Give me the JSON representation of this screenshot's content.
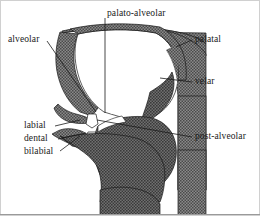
{
  "figure": {
    "type": "anatomical-diagram",
    "colors": {
      "tissue_fill": "#7d7d7d",
      "cavity_fill": "#ffffff",
      "outline": "#1a1a1a",
      "leader_line": "#1a1a1a",
      "text": "#1a1a1a",
      "border": "#cccccc",
      "background": "#ffffff"
    },
    "labels": [
      {
        "id": "palato-alveolar",
        "text": "palato-alveolar",
        "x": 107,
        "y": 8,
        "align": "left",
        "leader": {
          "x1": 105,
          "y1": 18,
          "x2": 105,
          "y2": 113
        }
      },
      {
        "id": "alveolar",
        "text": "alveolar",
        "x": 8,
        "y": 34,
        "align": "left",
        "leader": {
          "x1": 47,
          "y1": 41,
          "x2": 96,
          "y2": 112
        }
      },
      {
        "id": "palatal",
        "text": "palatal",
        "x": 195,
        "y": 34,
        "align": "left",
        "leader": {
          "x1": 192,
          "y1": 40,
          "x2": 176,
          "y2": 47
        }
      },
      {
        "id": "velar",
        "text": "velar",
        "x": 195,
        "y": 76,
        "align": "left",
        "leader": {
          "x1": 192,
          "y1": 82,
          "x2": 160,
          "y2": 78
        }
      },
      {
        "id": "labial",
        "text": "labial",
        "x": 24,
        "y": 120,
        "align": "left",
        "leader": {
          "x1": 55,
          "y1": 126,
          "x2": 80,
          "y2": 120
        }
      },
      {
        "id": "dental",
        "text": "dental",
        "x": 24,
        "y": 133,
        "align": "left",
        "leader": {
          "x1": 58,
          "y1": 139,
          "x2": 86,
          "y2": 133
        }
      },
      {
        "id": "bilabial",
        "text": "bilabial",
        "x": 24,
        "y": 146,
        "align": "left",
        "leader": {
          "x1": 60,
          "y1": 151,
          "x2": 80,
          "y2": 136
        }
      },
      {
        "id": "post-alveolar",
        "text": "post-alveolar",
        "x": 195,
        "y": 131,
        "align": "left",
        "leader": {
          "x1": 192,
          "y1": 137,
          "x2": 97,
          "y2": 120
        }
      }
    ],
    "articulation_points": [
      {
        "name": "palato-alveolar",
        "x": 105,
        "y": 113
      },
      {
        "name": "alveolar",
        "x": 96,
        "y": 112
      },
      {
        "name": "palatal",
        "x": 176,
        "y": 47
      },
      {
        "name": "velar",
        "x": 160,
        "y": 78
      },
      {
        "name": "labial",
        "x": 80,
        "y": 120
      },
      {
        "name": "dental",
        "x": 86,
        "y": 133
      },
      {
        "name": "bilabial",
        "x": 80,
        "y": 136
      },
      {
        "name": "post-alveolar",
        "x": 97,
        "y": 120
      }
    ]
  }
}
